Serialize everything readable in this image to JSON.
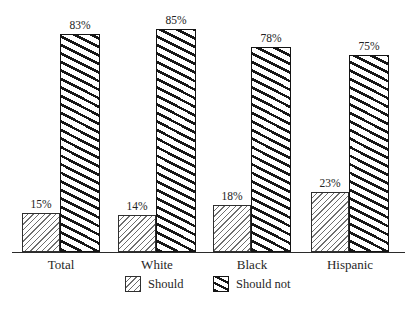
{
  "chart_data": {
    "type": "bar",
    "categories": [
      "Total",
      "White",
      "Black",
      "Hispanic"
    ],
    "series": [
      {
        "name": "Should",
        "values": [
          15,
          14,
          18,
          23
        ],
        "value_labels": [
          "15%",
          "14%",
          "18%",
          "23%"
        ],
        "hatch": "thin-forward-diagonal"
      },
      {
        "name": "Should not",
        "values": [
          83,
          85,
          78,
          75
        ],
        "value_labels": [
          "83%",
          "85%",
          "78%",
          "75%"
        ],
        "hatch": "thick-backward-diagonal"
      }
    ],
    "title": "",
    "xlabel": "",
    "ylabel": "",
    "ylim": [
      0,
      100
    ],
    "grid": false,
    "y_axis_visible": false,
    "x_baseline_visible": true,
    "legend_position": "bottom-center"
  },
  "colors": {
    "foreground": "#1c1c1c",
    "background": "#ffffff",
    "thin_hatch": "#6e6e6e",
    "thick_hatch": "#161616"
  }
}
